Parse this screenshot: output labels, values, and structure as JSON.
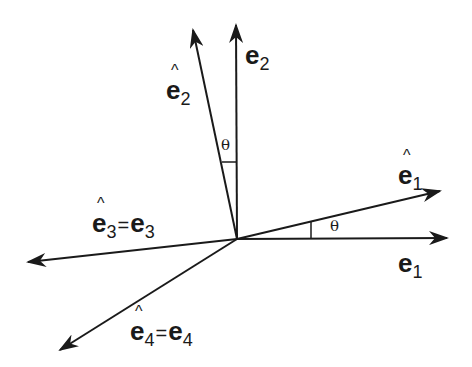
{
  "diagram": {
    "type": "vector-basis-rotation",
    "colors": {
      "stroke": "#1a1a1a",
      "background": "#ffffff"
    },
    "origin": [
      237,
      239
    ],
    "vectors": [
      {
        "id": "e1",
        "label": "e",
        "subscript": "1",
        "hat": false,
        "tip": [
          447,
          238
        ]
      },
      {
        "id": "e1hat",
        "label": "e",
        "subscript": "1",
        "hat": true,
        "tip": [
          440,
          191
        ]
      },
      {
        "id": "e2",
        "label": "e",
        "subscript": "2",
        "hat": false,
        "tip": [
          236,
          25
        ]
      },
      {
        "id": "e2hat",
        "label": "e",
        "subscript": "2",
        "hat": true,
        "tip": [
          193,
          30
        ]
      },
      {
        "id": "e3",
        "label": "e",
        "subscript": "3",
        "hat": false,
        "tip": [
          28,
          262
        ]
      },
      {
        "id": "e4",
        "label": "e",
        "subscript": "4",
        "hat": false,
        "tip": [
          60,
          350
        ]
      }
    ],
    "labels": {
      "e1": {
        "base": "e",
        "sub": "1"
      },
      "e1hat": {
        "base": "e",
        "sub": "1"
      },
      "e2": {
        "base": "e",
        "sub": "2"
      },
      "e2hat": {
        "base": "e",
        "sub": "2"
      },
      "e3": {
        "lhs_base": "e",
        "lhs_sub": "3",
        "eq": "=",
        "rhs_base": "e",
        "rhs_sub": "3"
      },
      "e4": {
        "lhs_base": "e",
        "lhs_sub": "4",
        "eq": "=",
        "rhs_base": "e",
        "rhs_sub": "4"
      }
    },
    "angles": [
      {
        "id": "theta-vertical",
        "symbol": "θ",
        "between": [
          "e2",
          "e2hat"
        ]
      },
      {
        "id": "theta-horizontal",
        "symbol": "θ",
        "between": [
          "e1",
          "e1hat"
        ]
      }
    ]
  }
}
